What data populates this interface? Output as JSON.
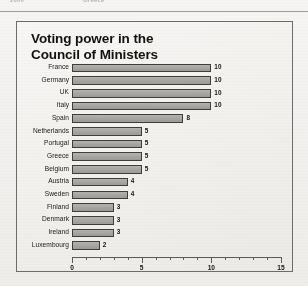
{
  "page": {
    "table_remnant": {
      "left_cell": "2000",
      "right_cell": "Greece"
    }
  },
  "figure": {
    "title": "Voting power in the\nCouncil of Ministers"
  },
  "chart_data": {
    "type": "bar",
    "orientation": "horizontal",
    "title": "Voting power in the Council of Ministers",
    "xlabel": "",
    "ylabel": "",
    "xlim": [
      0,
      15
    ],
    "xticks": [
      0,
      5,
      10,
      15
    ],
    "xtick_labels": [
      "0",
      "5",
      "10",
      "15"
    ],
    "minor_tick_interval": 1,
    "grid": false,
    "legend": null,
    "data_labels": true,
    "categories": [
      "France",
      "Germany",
      "UK",
      "Italy",
      "Spain",
      "Netherlands",
      "Portugal",
      "Greece",
      "Belgium",
      "Austria",
      "Sweden",
      "Finland",
      "Denmark",
      "Ireland",
      "Luxembourg"
    ],
    "values": [
      10,
      10,
      10,
      10,
      8,
      5,
      5,
      5,
      5,
      4,
      4,
      3,
      3,
      3,
      2
    ],
    "bar_color": "#a9a7a4",
    "bar_edge_color": "#403e3c"
  }
}
